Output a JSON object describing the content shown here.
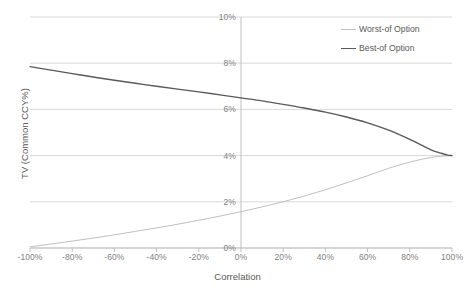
{
  "chart_data": {
    "type": "line",
    "title": "",
    "xlabel": "Correlation",
    "ylabel": "TV (Common CCY%)",
    "xlim": [
      -100,
      100
    ],
    "ylim": [
      0,
      10
    ],
    "grid": true,
    "legend_position": "top-right",
    "x_tick_labels": [
      "-100%",
      "-80%",
      "-60%",
      "-40%",
      "-20%",
      "0%",
      "20%",
      "40%",
      "60%",
      "80%",
      "100%"
    ],
    "x_tick_values": [
      -100,
      -80,
      -60,
      -40,
      -20,
      0,
      20,
      40,
      60,
      80,
      100
    ],
    "y_tick_labels": [
      "0%",
      "2%",
      "4%",
      "6%",
      "8%",
      "10%"
    ],
    "y_tick_values": [
      0,
      2,
      4,
      6,
      8,
      10
    ],
    "x": [
      -100,
      -90,
      -80,
      -70,
      -60,
      -50,
      -40,
      -30,
      -20,
      -10,
      0,
      10,
      20,
      30,
      40,
      50,
      60,
      70,
      80,
      90,
      95,
      98,
      100
    ],
    "series": [
      {
        "name": "Worst-of Option",
        "color": "#bfbfbf",
        "width": 1,
        "values": [
          0.05,
          0.17,
          0.3,
          0.43,
          0.57,
          0.72,
          0.87,
          1.03,
          1.2,
          1.38,
          1.57,
          1.78,
          2.0,
          2.25,
          2.52,
          2.82,
          3.13,
          3.45,
          3.72,
          3.92,
          3.97,
          3.99,
          4.0
        ]
      },
      {
        "name": "Best-of Option",
        "color": "#595959",
        "width": 1.4,
        "values": [
          7.85,
          7.7,
          7.55,
          7.4,
          7.26,
          7.13,
          7.0,
          6.88,
          6.76,
          6.63,
          6.5,
          6.37,
          6.22,
          6.06,
          5.88,
          5.67,
          5.42,
          5.1,
          4.7,
          4.25,
          4.1,
          4.02,
          4.0
        ]
      }
    ],
    "legend": [
      {
        "label": "Worst-of Option",
        "style": "thin",
        "color": "#bfbfbf"
      },
      {
        "label": "Best-of Option",
        "style": "thick",
        "color": "#595959"
      }
    ],
    "colors": {
      "gridline": "#d9d9d9",
      "axis_line": "#bfbfbf",
      "tick_text": "#7f7f7f",
      "title_text": "#595959",
      "background": "#ffffff"
    }
  }
}
